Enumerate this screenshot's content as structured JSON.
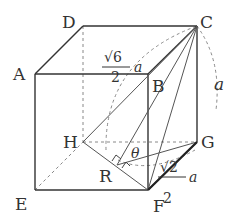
{
  "figure": {
    "type": "cube-geometry",
    "vertices": {
      "A": "A",
      "B": "B",
      "C": "C",
      "D": "D",
      "E": "E",
      "F": "F",
      "G": "G",
      "H": "H",
      "R": "R"
    },
    "annotations": {
      "CR_length_num": "√6",
      "CR_length_den": "2",
      "CR_length_var": "a",
      "edge_length": "a",
      "RG_length_num": "√2",
      "RG_length_den": "2",
      "RG_length_var": "a",
      "angle": "θ"
    },
    "colors": {
      "line": "#333333",
      "thin": "#666666",
      "dashed": "#888888"
    }
  }
}
